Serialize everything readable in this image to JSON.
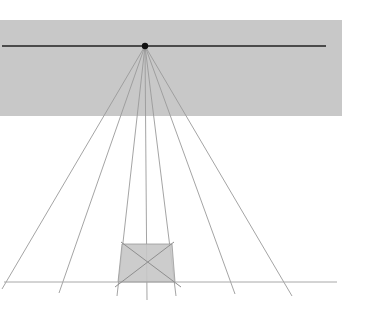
{
  "diagram": {
    "colors": {
      "background": "#ffffff",
      "sky_band": "#c8c8c8",
      "horizon_line": "#222222",
      "vanishing_point": "#111111",
      "orthogonals": "#9a9a9a",
      "ground_line": "#a8a8a8",
      "square_fill": "#c6c6c6",
      "square_stroke": "#999999",
      "diagonals": "#8e8e8e"
    },
    "sky_band": {
      "x": 0,
      "y": 20,
      "width": 342,
      "height": 96
    },
    "horizon_line": {
      "x1": 2,
      "y1": 46,
      "x2": 326,
      "y2": 46
    },
    "vanishing_point": {
      "cx": 145,
      "cy": 46,
      "r": 3.2
    },
    "ground_line": {
      "x1": 4,
      "y1": 282,
      "x2": 337,
      "y2": 282
    },
    "orthogonals": [
      {
        "x2": 2,
        "y2": 289
      },
      {
        "x2": 59,
        "y2": 293
      },
      {
        "x2": 117,
        "y2": 296
      },
      {
        "x2": 147,
        "y2": 300
      },
      {
        "x2": 176,
        "y2": 296
      },
      {
        "x2": 235,
        "y2": 294
      },
      {
        "x2": 292,
        "y2": 296
      }
    ],
    "square": {
      "points": [
        [
          122,
          244
        ],
        [
          172,
          244
        ],
        [
          175,
          282
        ],
        [
          118,
          282
        ]
      ]
    },
    "diagonals": [
      {
        "x1": 121,
        "y1": 242,
        "x2": 181,
        "y2": 287
      },
      {
        "x1": 174,
        "y1": 242,
        "x2": 115,
        "y2": 287
      }
    ]
  }
}
